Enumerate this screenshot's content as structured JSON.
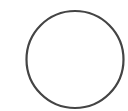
{
  "canvas": {
    "width": 128,
    "height": 111,
    "background": "#ffffff"
  },
  "shape": {
    "type": "circle",
    "icon": "circle-outline-icon",
    "cx": 75,
    "cy": 59.5,
    "r": 48.5,
    "stroke": "#444444",
    "stroke_width": 2.2,
    "fill": "none"
  }
}
